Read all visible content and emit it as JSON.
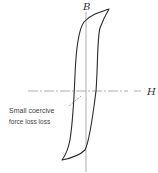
{
  "diagram": {
    "type": "hysteresis-loop",
    "axes": {
      "vertical_label": "B",
      "horizontal_label": "H"
    },
    "annotation": {
      "line1": "Small coercive",
      "line2": "force loss loss"
    },
    "colors": {
      "loop": "#2a2a2a",
      "axis": "#9a9a9a",
      "text": "#444444"
    }
  }
}
